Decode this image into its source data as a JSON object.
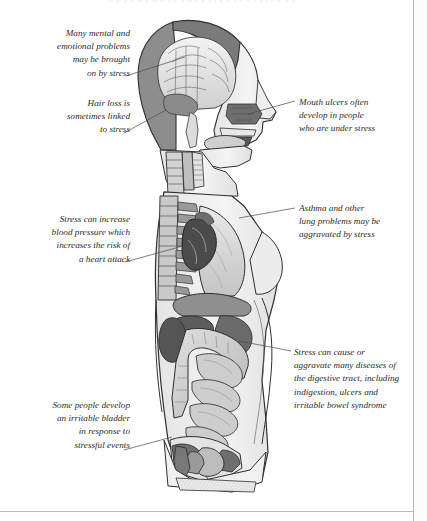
{
  "page": {
    "running_head": "a p p e a r a n c e   t h e   e f f e c t s   o f   s t r e s s",
    "background_color": "#ffffff",
    "rule_color": "#b9b9b9",
    "text_color": "#2b2b2b",
    "leader_color": "#4a4a4a"
  },
  "illustration": {
    "title": "sagittal-cross-section-of-human-body",
    "description": "Grayscale anatomical side-view cut-away of a human figure showing brain, nasal cavity, mouth, spine, ribs, lung, heart, diaphragm, stomach, kidney, small and large intestine, bladder and pelvic organs",
    "palette": {
      "skin_outline": "#2f2f2f",
      "skin_fill": "#f2f2f2",
      "soft_tissue": "#d9d9d9",
      "mid_tone": "#a8a8a8",
      "dark_tone": "#6a6a6a",
      "darkest_tone": "#3a3a3a"
    },
    "parts": [
      "scalp",
      "skull",
      "brain",
      "cerebellum",
      "brain-stem",
      "nasal-cavity",
      "tongue",
      "mouth",
      "jaw",
      "throat",
      "trachea",
      "oesophagus",
      "spine",
      "ribs",
      "lung",
      "heart",
      "diaphragm",
      "breast",
      "liver",
      "stomach",
      "kidney",
      "large-intestine",
      "small-intestine",
      "colon",
      "bladder",
      "pelvis",
      "rectum",
      "uterus"
    ]
  },
  "annotations": [
    {
      "id": "brain-note",
      "text": "Many mental and\nemotional problems\nmay be brought\non by stress",
      "align": "right",
      "x": 14,
      "y": 27,
      "w": 116,
      "leader": {
        "x1": 126,
        "y1": 76,
        "x2": 185,
        "y2": 57
      }
    },
    {
      "id": "hair-note",
      "text": "Hair loss is\nsometimes linked\nto stress",
      "align": "right",
      "x": 24,
      "y": 97,
      "w": 106,
      "leader": {
        "x1": 124,
        "y1": 133,
        "x2": 166,
        "y2": 110
      }
    },
    {
      "id": "heart-note",
      "text": "Stress can increase\nblood pressure which\nincreases the risk of\na heart attack",
      "align": "right",
      "x": 10,
      "y": 213,
      "w": 120,
      "leader": {
        "x1": 125,
        "y1": 262,
        "x2": 194,
        "y2": 243
      }
    },
    {
      "id": "bladder-note",
      "text": "Some people develop\nan irritable bladder\nin response to\nstressful events",
      "align": "right",
      "x": 10,
      "y": 399,
      "w": 120,
      "leader": {
        "x1": 124,
        "y1": 450,
        "x2": 172,
        "y2": 437
      }
    },
    {
      "id": "mouth-note",
      "text": "Mouth ulcers often\ndevelop in people\nwho are under stress",
      "align": "left",
      "x": 299,
      "y": 96,
      "w": 122,
      "leader": {
        "x1": 295,
        "y1": 101,
        "x2": 248,
        "y2": 114
      }
    },
    {
      "id": "lung-note",
      "text": "Asthma and other\nlung problems may be\naggravated by stress",
      "align": "left",
      "x": 299,
      "y": 202,
      "w": 122,
      "leader": {
        "x1": 295,
        "y1": 208,
        "x2": 239,
        "y2": 218
      }
    },
    {
      "id": "digestive-note",
      "text": "Stress can cause or\naggravate many diseases of\nthe digestive tract, including\nindigestion, ulcers and\nirritable bowel syndrome",
      "align": "left",
      "x": 294,
      "y": 346,
      "w": 128,
      "leader": {
        "x1": 291,
        "y1": 351,
        "x2": 239,
        "y2": 341
      }
    }
  ]
}
